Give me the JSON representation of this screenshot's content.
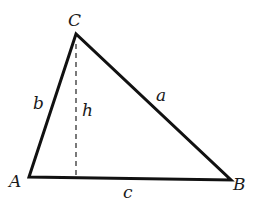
{
  "diagram": {
    "type": "triangle-with-altitude",
    "vertices": {
      "A": {
        "label": "A",
        "x": 29,
        "y": 177
      },
      "B": {
        "label": "B",
        "x": 231,
        "y": 180
      },
      "C": {
        "label": "C",
        "x": 76,
        "y": 34
      }
    },
    "sides": {
      "a": {
        "label": "a",
        "from": "C",
        "to": "B"
      },
      "b": {
        "label": "b",
        "from": "A",
        "to": "C"
      },
      "c": {
        "label": "c",
        "from": "A",
        "to": "B"
      }
    },
    "altitude": {
      "label": "h",
      "from": "C",
      "style": "dashed"
    },
    "colors": {
      "line": "#111111",
      "text": "#1a1a1a",
      "background": "#ffffff"
    }
  }
}
